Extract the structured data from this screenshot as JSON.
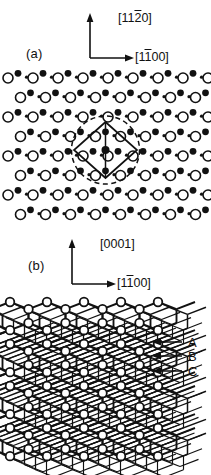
{
  "figure": {
    "panels": [
      {
        "id": "a",
        "label": "(a)",
        "axes": {
          "vertical": {
            "text": "[1120]",
            "pre": "[11",
            "bar": "2",
            "post": "0]",
            "direction": "up"
          },
          "horizontal": {
            "text": "[1100]",
            "pre": "[1",
            "bar": "1",
            "post": "00]",
            "direction": "right"
          }
        }
      },
      {
        "id": "b",
        "label": "(b)",
        "axes": {
          "vertical": {
            "text": "[0001]",
            "pre": "[0001]",
            "bar": "",
            "post": "",
            "direction": "up"
          },
          "horizontal": {
            "text": "[1100]",
            "pre": "[1",
            "bar": "1",
            "post": "00]",
            "direction": "right"
          }
        },
        "layer_labels": [
          "A",
          "B",
          "C"
        ]
      }
    ],
    "colors": {
      "ink": "#111111",
      "background": "#ffffff",
      "atom_open_fill": "#ffffff",
      "atom_filled_fill": "#111111"
    },
    "atom_legend": {
      "large_open": "large-open-circle-atom",
      "medium_filled": "medium-filled-circle-atom",
      "small_filled": "small-filled-dot-atom"
    },
    "unit_cell": {
      "shape": "rhombus",
      "overlay": "dashed-circle"
    }
  }
}
